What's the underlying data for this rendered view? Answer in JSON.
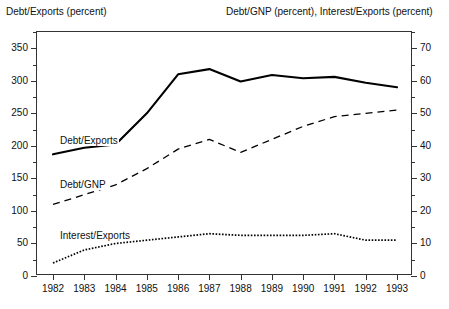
{
  "headers": {
    "left": "Debt/Exports (percent)",
    "right": "Debt/GNP (percent), Interest/Exports (percent)"
  },
  "axes": {
    "left_ticks": [
      "0",
      "50",
      "100",
      "150",
      "200",
      "250",
      "300",
      "350"
    ],
    "right_ticks": [
      "0",
      "10",
      "20",
      "30",
      "40",
      "50",
      "60",
      "70"
    ],
    "x_ticks": [
      "1982",
      "1983",
      "1984",
      "1985",
      "1986",
      "1987",
      "1988",
      "1989",
      "1990",
      "1991",
      "1992",
      "1993"
    ]
  },
  "series_labels": {
    "debt_exports": "Debt/Exports",
    "debt_gnp": "Debt/GNP",
    "interest_exports": "Interest/Exports"
  },
  "colors": {
    "line": "#000000",
    "frame": "#333333",
    "background": "#ffffff"
  },
  "chart_data": {
    "type": "line",
    "title": "",
    "xlabel": "",
    "ylabel": "Debt/Exports (percent)",
    "y2label": "Debt/GNP (percent), Interest/Exports (percent)",
    "categories": [
      "1982",
      "1983",
      "1984",
      "1985",
      "1986",
      "1987",
      "1988",
      "1989",
      "1990",
      "1991",
      "1992",
      "1993"
    ],
    "ylim": [
      0,
      375
    ],
    "y2lim": [
      0,
      75
    ],
    "grid": false,
    "legend": "inline-annotations",
    "series": [
      {
        "name": "Debt/Exports",
        "axis": "left",
        "style": "solid",
        "values": [
          187,
          197,
          202,
          250,
          310,
          318,
          299,
          309,
          304,
          306,
          297,
          290
        ]
      },
      {
        "name": "Debt/GNP",
        "axis": "right",
        "style": "dashed",
        "values": [
          22,
          25,
          28,
          33,
          39,
          42,
          38,
          42,
          46,
          49,
          50,
          51
        ]
      },
      {
        "name": "Interest/Exports",
        "axis": "right",
        "style": "dotted",
        "values": [
          4,
          8,
          10,
          11,
          12,
          13,
          12.5,
          12.5,
          12.5,
          13,
          11,
          11
        ]
      }
    ]
  }
}
